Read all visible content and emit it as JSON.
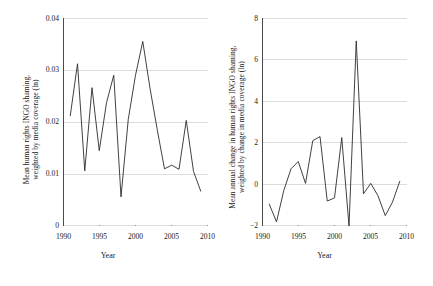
{
  "figure": {
    "background": "#ffffff",
    "line_color": "#2b2b2b",
    "grid_color": "#d9d9d9",
    "axis_color": "#555555"
  },
  "chart_data": [
    {
      "type": "line",
      "panel": "left",
      "title": "",
      "xlabel": "Year",
      "ylabel": "Mean human rights INGO shaming, weighted by media coverage (ln)",
      "ylabel_line1": "Mean human rights INGO shaming,",
      "ylabel_line2": "weighted by media coverage (ln)",
      "xlim": [
        1990,
        2010
      ],
      "ylim": [
        0,
        0.04
      ],
      "xticks": [
        1990,
        1995,
        2000,
        2005,
        2010
      ],
      "xticklabels": [
        "1990",
        "1995",
        "2000",
        "2005",
        "2010"
      ],
      "yticks": [
        0,
        0.01,
        0.02,
        0.03,
        0.04
      ],
      "yticklabels": [
        "0",
        "0.01",
        "0.02",
        "0.03",
        "0.04"
      ],
      "grid": "horizontal",
      "legend": "none",
      "x": [
        1991,
        1992,
        1993,
        1994,
        1995,
        1996,
        1997,
        1998,
        1999,
        2000,
        2001,
        2002,
        2003,
        2004,
        2005,
        2006,
        2007,
        2008,
        2009
      ],
      "values": [
        0.0212,
        0.0312,
        0.0106,
        0.0266,
        0.0145,
        0.0237,
        0.029,
        0.0056,
        0.0205,
        0.029,
        0.0355,
        0.0265,
        0.0185,
        0.011,
        0.0117,
        0.0109,
        0.0203,
        0.0105,
        0.0067
      ]
    },
    {
      "type": "line",
      "panel": "right",
      "title": "",
      "xlabel": "Year",
      "ylabel": "Mean annual change in human rights INGO shaming, weighted by change in media coverage (ln)",
      "ylabel_line1": "Mean annual change in human rights INGO shaming,",
      "ylabel_line2": "weighted by change in media coverage (ln)",
      "xlim": [
        1990,
        2010
      ],
      "ylim": [
        -2,
        8
      ],
      "xticks": [
        1990,
        1995,
        2000,
        2005,
        2010
      ],
      "xticklabels": [
        "1990",
        "1995",
        "2000",
        "2005",
        "2010"
      ],
      "yticks": [
        -2,
        0,
        2,
        4,
        6,
        8
      ],
      "yticklabels": [
        "−2",
        "0",
        "2",
        "4",
        "6",
        "8"
      ],
      "grid": "horizontal",
      "legend": "none",
      "x": [
        1991,
        1992,
        1993,
        1994,
        1995,
        1996,
        1997,
        1998,
        1999,
        2000,
        2001,
        2002,
        2003,
        2004,
        2005,
        2006,
        2007,
        2008,
        2009
      ],
      "values": [
        -0.95,
        -1.8,
        -0.3,
        0.75,
        1.1,
        0.05,
        2.1,
        2.3,
        -0.8,
        -0.65,
        2.25,
        -2.0,
        6.9,
        -0.45,
        0.05,
        -0.55,
        -1.5,
        -0.85,
        0.15
      ]
    }
  ]
}
